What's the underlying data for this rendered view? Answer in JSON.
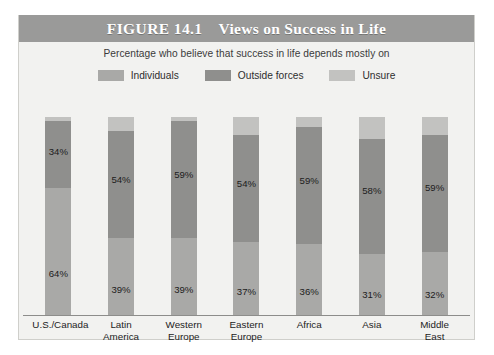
{
  "figure": {
    "number_label": "FIGURE 14.1",
    "title": "Views on Success in Life",
    "subtitle": "Percentage who believe that success in life depends mostly on"
  },
  "colors": {
    "title_band": "#9a9a99",
    "panel_background": "#f2f2f0",
    "individuals": "#a9a9a7",
    "outside_forces": "#8f8f8d",
    "unsure": "#c2c2c0",
    "axis": "#8d8d8b",
    "text": "#1c1c1c"
  },
  "legend": {
    "position": "top-center",
    "items": [
      {
        "label": "Individuals",
        "color": "#a9a9a7",
        "key": "individuals"
      },
      {
        "label": "Outside forces",
        "color": "#8f8f8d",
        "key": "outside_forces"
      },
      {
        "label": "Unsure",
        "color": "#c2c2c0",
        "key": "unsure"
      }
    ]
  },
  "chart_data": {
    "type": "bar",
    "subtype": "stacked-vertical",
    "title": "Views on Success in Life",
    "subtitle": "Percentage who believe that success in life depends mostly on",
    "xlabel": "",
    "ylabel": "",
    "ylim": [
      0,
      100
    ],
    "grid": false,
    "legend_position": "top-center",
    "value_label_suffix": "%",
    "categories": [
      "U.S./Canada",
      "Latin America",
      "Western Europe",
      "Eastern Europe",
      "Africa",
      "Asia",
      "Middle East"
    ],
    "category_lines": [
      [
        "U.S./Canada",
        ""
      ],
      [
        "Latin",
        "America"
      ],
      [
        "Western",
        "Europe"
      ],
      [
        "Eastern",
        "Europe"
      ],
      [
        "Africa",
        ""
      ],
      [
        "Asia",
        ""
      ],
      [
        "Middle",
        "East"
      ]
    ],
    "series": [
      {
        "name": "Individuals",
        "color": "#a9a9a7",
        "values": [
          64,
          39,
          39,
          37,
          36,
          31,
          32
        ],
        "labels": [
          "64%",
          "39%",
          "39%",
          "37%",
          "36%",
          "31%",
          "32%"
        ]
      },
      {
        "name": "Outside forces",
        "color": "#8f8f8d",
        "values": [
          34,
          54,
          59,
          54,
          59,
          58,
          59
        ],
        "labels": [
          "34%",
          "54%",
          "59%",
          "54%",
          "59%",
          "58%",
          "59%"
        ]
      },
      {
        "name": "Unsure",
        "color": "#c2c2c0",
        "values": [
          2,
          7,
          2,
          9,
          5,
          11,
          9
        ],
        "labels": [
          "",
          "",
          "",
          "",
          "",
          "",
          ""
        ]
      }
    ]
  }
}
